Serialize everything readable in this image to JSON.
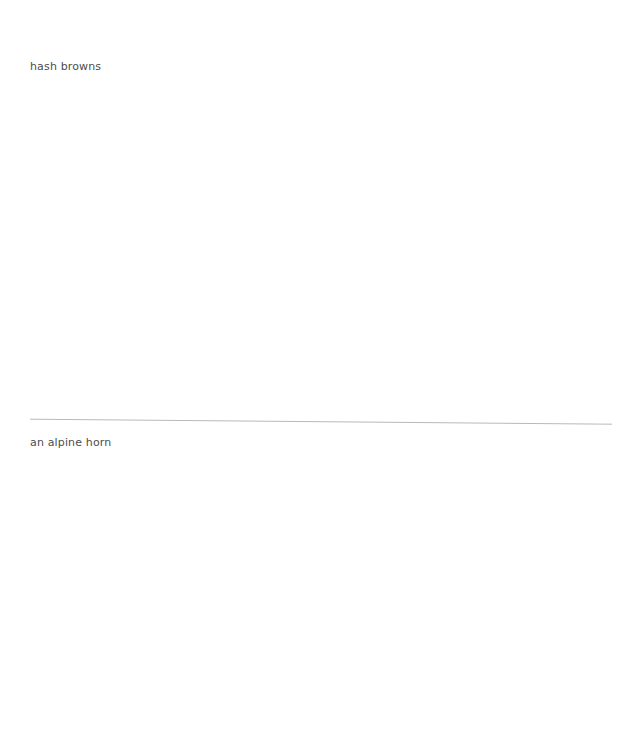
{
  "page": {
    "background_color": "#ffffff",
    "width": 626,
    "height": 749
  },
  "clipped_top_row": {
    "visible_text": "",
    "note_color": "#fcfcfd"
  },
  "list": {
    "separator_color": "#b9b9b9",
    "text_color": "#4c4c4c",
    "items": [
      {
        "label": "hash browns"
      },
      {
        "label": "an alpine horn"
      }
    ]
  }
}
